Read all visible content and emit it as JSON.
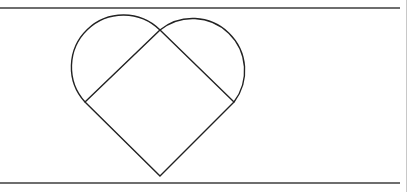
{
  "figure": {
    "stroke_color": "#222222",
    "rule_color": "#6e6e6e",
    "edge_color": "#c8c8c8",
    "square": {
      "top": [
        160,
        30
      ],
      "left": [
        85,
        102
      ],
      "bottom": [
        160,
        176
      ],
      "right": [
        234,
        102
      ]
    },
    "arcs": [
      {
        "name": "left-lobe",
        "from": [
          85,
          102
        ],
        "to": [
          160,
          30
        ],
        "radius": 52
      },
      {
        "name": "right-lobe",
        "from": [
          160,
          30
        ],
        "to": [
          234,
          102
        ],
        "radius": 52
      }
    ],
    "rules": {
      "top_y": 7,
      "bottom_y": 182,
      "width": 400
    }
  }
}
